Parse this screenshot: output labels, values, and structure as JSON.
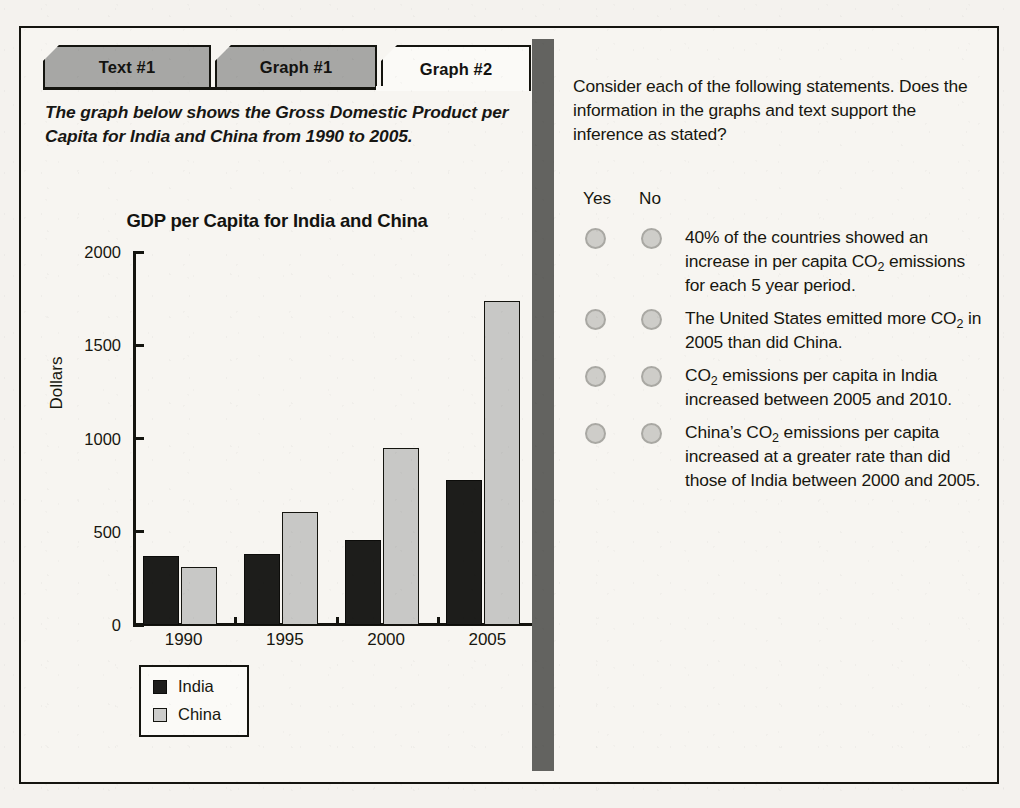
{
  "tabs": [
    {
      "label": "Text #1",
      "active": false
    },
    {
      "label": "Graph #1",
      "active": false
    },
    {
      "label": "Graph #2",
      "active": true
    }
  ],
  "intro": "The graph below shows the Gross Domestic Product per Capita for India and China from 1990 to 2005.",
  "question_panel": {
    "prompt": "Consider each of the following statements. Does the information in the graphs and text support the inference as stated?",
    "column_headers": {
      "yes": "Yes",
      "no": "No"
    },
    "statements": [
      {
        "parts": [
          {
            "t": "text",
            "v": "40% of the countries showed an increase in per capita CO"
          },
          {
            "t": "sub",
            "v": "2"
          },
          {
            "t": "text",
            "v": " emissions for each 5 year period."
          }
        ]
      },
      {
        "parts": [
          {
            "t": "text",
            "v": "The United States emitted more CO"
          },
          {
            "t": "sub",
            "v": "2"
          },
          {
            "t": "text",
            "v": " in 2005 than did China."
          }
        ]
      },
      {
        "parts": [
          {
            "t": "text",
            "v": "CO"
          },
          {
            "t": "sub",
            "v": "2"
          },
          {
            "t": "text",
            "v": " emissions per capita in India increased between 2005 and 2010."
          }
        ]
      },
      {
        "parts": [
          {
            "t": "text",
            "v": "China’s CO"
          },
          {
            "t": "sub",
            "v": "2"
          },
          {
            "t": "text",
            "v": " emissions per capita increased at a greater rate than did those of India between 2000 and 2005."
          }
        ]
      }
    ]
  },
  "chart_data": {
    "type": "bar",
    "title": "GDP per Capita for India and China",
    "xlabel": "",
    "ylabel": "Dollars",
    "categories": [
      "1990",
      "1995",
      "2000",
      "2005"
    ],
    "series": [
      {
        "name": "India",
        "color": "#1d1d1b",
        "values": [
          370,
          380,
          455,
          775
        ]
      },
      {
        "name": "China",
        "color": "#c8c8c6",
        "values": [
          310,
          605,
          950,
          1735
        ]
      }
    ],
    "ylim": [
      0,
      2000
    ],
    "yticks": [
      0,
      500,
      1000,
      1500,
      2000
    ],
    "ytick_labels": [
      "0",
      "500",
      "1000",
      "1500",
      "2000"
    ],
    "grid": false,
    "legend": {
      "position": "below-axes",
      "entries": [
        "India",
        "China"
      ]
    }
  },
  "colors": {
    "ink": "#14140f",
    "paper": "#f7f5f1",
    "tab_inactive": "#a7a7a5",
    "tab_active": "#fbfaf7",
    "divider": "#636360",
    "radio_fill": "#cecdc9",
    "radio_border": "#a9a8a3"
  }
}
